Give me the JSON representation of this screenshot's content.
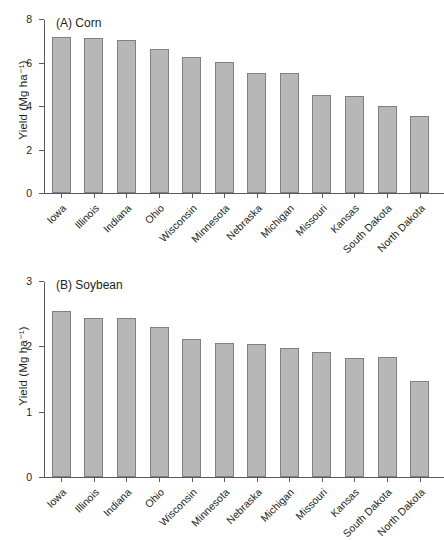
{
  "figure": {
    "ylabel": "Yield (Mg ha⁻¹)"
  },
  "chart_data": [
    {
      "type": "bar",
      "panel": "A",
      "title": "(A) Corn",
      "xlabel": "",
      "ylabel": "Yield (Mg ha⁻¹)",
      "ylim": [
        0,
        8
      ],
      "yticks": [
        0,
        2,
        4,
        6,
        8
      ],
      "ytick_labels": [
        "0",
        "2",
        "4",
        "6",
        "8"
      ],
      "grid": false,
      "legend": "none",
      "bar_color": "#b7b7b7",
      "bar_edge_color": "#808080",
      "categories": [
        "Iowa",
        "Illinois",
        "Indiana",
        "Ohio",
        "Wisconsin",
        "Minnesota",
        "Nebraska",
        "Michigan",
        "Missouri",
        "Kansas",
        "South Dakota",
        "North Dakota"
      ],
      "values": [
        7.2,
        7.15,
        7.08,
        6.66,
        6.3,
        6.05,
        5.53,
        5.55,
        4.52,
        4.48,
        4.03,
        3.57
      ]
    },
    {
      "type": "bar",
      "panel": "B",
      "title": "(B) Soybean",
      "xlabel": "",
      "ylabel": "Yield (Mg ha⁻¹)",
      "ylim": [
        0,
        3
      ],
      "yticks": [
        0,
        1,
        2,
        3
      ],
      "ytick_labels": [
        "0",
        "1",
        "2",
        "3"
      ],
      "grid": false,
      "legend": "none",
      "bar_color": "#b7b7b7",
      "bar_edge_color": "#808080",
      "categories": [
        "Iowa",
        "Illinois",
        "Indiana",
        "Ohio",
        "Wisconsin",
        "Minnesota",
        "Nebraska",
        "Michigan",
        "Missouri",
        "Kansas",
        "South Dakota",
        "North Dakota"
      ],
      "values": [
        2.56,
        2.44,
        2.44,
        2.31,
        2.12,
        2.06,
        2.05,
        1.98,
        1.93,
        1.83,
        1.84,
        1.48
      ]
    }
  ]
}
